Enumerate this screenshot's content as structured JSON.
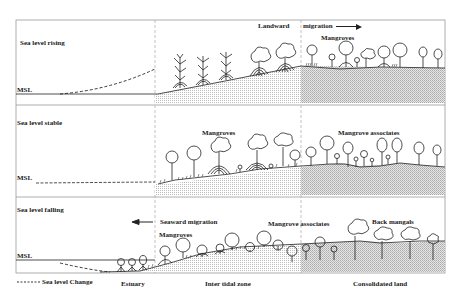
{
  "panels": [
    {
      "title": "Sea level rising",
      "msl_label": "MSL",
      "annotations": {
        "landward": "Landward",
        "migration": "migration",
        "mangroves": "Mangroves"
      }
    },
    {
      "title": "Sea level stable",
      "msl_label": "MSL",
      "annotations": {
        "mangroves": "Mangroves",
        "mangrove_associates": "Mangrove associates"
      }
    },
    {
      "title": "Sea level falling",
      "msl_label": "MSL",
      "annotations": {
        "seaward_migration": "Seaward migration",
        "mangroves": "Mangroves",
        "mangrove_associates": "Mangrove associates",
        "back_mangals": "Back mangals"
      }
    }
  ],
  "legend": {
    "sea_level_change": "Sea level Change"
  },
  "zones": {
    "estuary": "Estuary",
    "intertidal": "Inter tidal zone",
    "consolidated": "Consolidated land"
  },
  "colors": {
    "line": "#222222",
    "frame": "#999999",
    "stipple_light": "#d8d8d8",
    "stipple_dark": "#c8c8c8"
  }
}
